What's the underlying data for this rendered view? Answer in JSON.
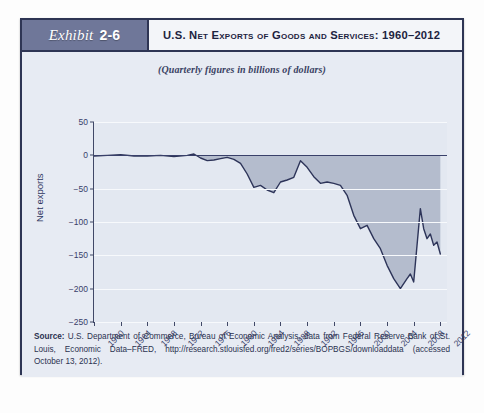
{
  "exhibit": {
    "badge_word": "Exhibit",
    "badge_number": "2-6",
    "title": "U.S. Net Exports of Goods and Services: 1960–2012"
  },
  "chart_data": {
    "type": "area",
    "title": "U.S. Net Exports of Goods and Services: 1960–2012",
    "subtitle": "(Quarterly figures in billions of dollars)",
    "xlabel": "",
    "ylabel": "Net exports",
    "ylim": [
      -250,
      50
    ],
    "xlim": [
      1960,
      2013
    ],
    "yticks": [
      50,
      0,
      -50,
      -100,
      -150,
      -200,
      -250
    ],
    "ytick_labels": [
      "50",
      "0",
      "−50",
      "−100",
      "−150",
      "−200",
      "−250"
    ],
    "xticks": [
      1960,
      1964,
      1968,
      1972,
      1976,
      1980,
      1984,
      1988,
      1992,
      1996,
      2000,
      2004,
      2008,
      2012
    ],
    "xtick_labels": [
      "1960",
      "1964",
      "1968",
      "1972",
      "1976",
      "1980",
      "1984",
      "1988",
      "1992",
      "1996",
      "2000",
      "2004",
      "2008",
      "2012"
    ],
    "grid": true,
    "legend": "none",
    "zero_reference": 0,
    "series": [
      {
        "name": "Net exports",
        "units": "billions of dollars",
        "x": [
          1960,
          1961,
          1962,
          1963,
          1964,
          1965,
          1966,
          1967,
          1968,
          1969,
          1970,
          1971,
          1972,
          1973,
          1974,
          1975,
          1976,
          1977,
          1978,
          1979,
          1980,
          1981,
          1982,
          1983,
          1984,
          1985,
          1986,
          1987,
          1988,
          1989,
          1990,
          1991,
          1992,
          1993,
          1994,
          1995,
          1996,
          1997,
          1998,
          1999,
          2000,
          2001,
          2002,
          2003,
          2004,
          2005,
          2006,
          2006.75,
          2007.5,
          2008.25,
          2008.75,
          2009.25,
          2009.75,
          2010.5,
          2011,
          2011.5,
          2012
        ],
        "y": [
          4,
          5,
          4,
          5,
          7,
          5,
          3,
          3,
          1,
          1,
          3,
          -1,
          -5,
          2,
          -2,
          14,
          -2,
          -11,
          -11,
          -6,
          -12,
          -12,
          -19,
          -52,
          -94,
          -110,
          -131,
          -142,
          -107,
          -86,
          -77,
          -27,
          -33,
          -65,
          -93,
          -91,
          -96,
          -102,
          -161,
          -263,
          -380,
          -369,
          -425,
          -496,
          -608,
          -715,
          -763,
          -760,
          -713,
          -700,
          -382,
          -380,
          -500,
          -516,
          -560,
          -548,
          -560
        ],
        "y_display_note": "values plotted as quarterly billions; trough near −200 around 2006, sharp rebound to about −80 in 2009, ending near −145 in 2012",
        "color": "#2d3459",
        "fill_color": "#b4bccd"
      }
    ],
    "plotted_points": [
      {
        "x": 1960,
        "y": -1
      },
      {
        "x": 1962,
        "y": 0
      },
      {
        "x": 1964,
        "y": 1
      },
      {
        "x": 1966,
        "y": -1
      },
      {
        "x": 1968,
        "y": -1
      },
      {
        "x": 1970,
        "y": 0
      },
      {
        "x": 1972,
        "y": -2
      },
      {
        "x": 1974,
        "y": 0
      },
      {
        "x": 1975,
        "y": 2
      },
      {
        "x": 1976,
        "y": -4
      },
      {
        "x": 1977,
        "y": -8
      },
      {
        "x": 1978,
        "y": -7
      },
      {
        "x": 1979,
        "y": -5
      },
      {
        "x": 1980,
        "y": -3
      },
      {
        "x": 1981,
        "y": -6
      },
      {
        "x": 1982,
        "y": -12
      },
      {
        "x": 1983,
        "y": -28
      },
      {
        "x": 1984,
        "y": -48
      },
      {
        "x": 1985,
        "y": -45
      },
      {
        "x": 1986,
        "y": -52
      },
      {
        "x": 1987,
        "y": -56
      },
      {
        "x": 1988,
        "y": -40
      },
      {
        "x": 1989,
        "y": -37
      },
      {
        "x": 1990,
        "y": -33
      },
      {
        "x": 1991,
        "y": -8
      },
      {
        "x": 1992,
        "y": -18
      },
      {
        "x": 1993,
        "y": -32
      },
      {
        "x": 1994,
        "y": -42
      },
      {
        "x": 1995,
        "y": -40
      },
      {
        "x": 1996,
        "y": -42
      },
      {
        "x": 1997,
        "y": -45
      },
      {
        "x": 1998,
        "y": -60
      },
      {
        "x": 1999,
        "y": -90
      },
      {
        "x": 2000,
        "y": -110
      },
      {
        "x": 2001,
        "y": -105
      },
      {
        "x": 2002,
        "y": -125
      },
      {
        "x": 2003,
        "y": -140
      },
      {
        "x": 2004,
        "y": -165
      },
      {
        "x": 2005,
        "y": -185
      },
      {
        "x": 2006,
        "y": -200
      },
      {
        "x": 2007,
        "y": -185
      },
      {
        "x": 2007.5,
        "y": -178
      },
      {
        "x": 2008,
        "y": -190
      },
      {
        "x": 2009,
        "y": -80
      },
      {
        "x": 2009.5,
        "y": -110
      },
      {
        "x": 2010,
        "y": -125
      },
      {
        "x": 2010.5,
        "y": -118
      },
      {
        "x": 2011,
        "y": -135
      },
      {
        "x": 2011.5,
        "y": -130
      },
      {
        "x": 2012,
        "y": -148
      }
    ]
  },
  "source": {
    "label": "Source:",
    "text": " U.S. Department of Commerce, Bureau of Economic Analysis, data from Federal Reserve Bank of St. Louis, Economic Data–FRED, http://research.stlouisfed.org/fred2/series/BOPBGS/downloaddata (accessed October 13, 2012)."
  },
  "colors": {
    "card_border": "#2e3554",
    "badge_bg": "#6f7799",
    "line": "#2d3459",
    "fill": "#b4bccd",
    "plot_bg": "#e3e8f1",
    "body_bg": "#e7ebf3",
    "grid": "#f7f9fc"
  }
}
